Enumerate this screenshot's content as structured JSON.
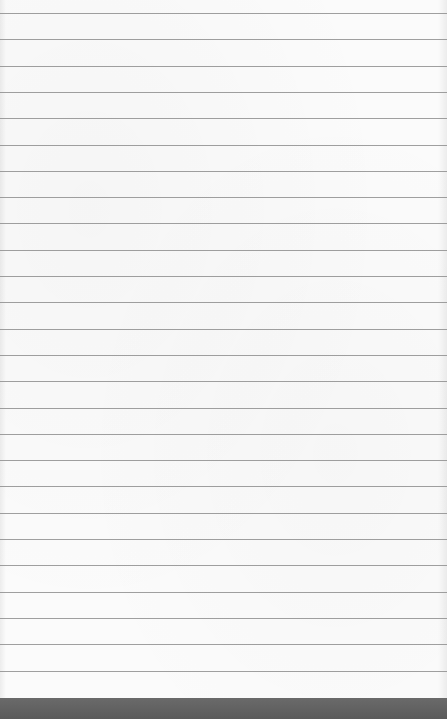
{
  "image": {
    "description": "Blank sheet of lined notebook paper",
    "ruled_lines": {
      "count": 26,
      "first_y": 13,
      "spacing": 26.3,
      "color": "#8e8e8e"
    },
    "paper_color": "#fbfbfb",
    "bottom_band_color": "#5e5e5e"
  }
}
